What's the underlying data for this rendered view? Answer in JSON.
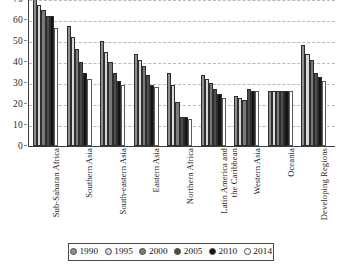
{
  "chart_data": {
    "type": "bar",
    "title": "",
    "subtitle": "",
    "xlabel": "",
    "ylabel": "",
    "ylim": [
      0,
      70
    ],
    "yticks": [
      0,
      10,
      20,
      30,
      40,
      50,
      60,
      70
    ],
    "grid": true,
    "legend_position": "bottom",
    "categories": [
      "Sub-Saharan Africa",
      "Southern Asia",
      "South-eastern Asia",
      "Eastern Asia",
      "Northern Africa",
      "Latin America and the Caribbean",
      "Western Asia",
      "Oceania",
      "Developing Regions"
    ],
    "category_lines": [
      [
        "Sub-Saharan Africa"
      ],
      [
        "Southern Asia"
      ],
      [
        "South-eastern Asia"
      ],
      [
        "Eastern Asia"
      ],
      [
        "Northern Africa"
      ],
      [
        "Latin America and",
        "the Caribbean"
      ],
      [
        "Western Asia"
      ],
      [
        "Oceania"
      ],
      [
        "Developing Regions"
      ]
    ],
    "series": [
      {
        "name": "1990",
        "color": "#8f8f8f",
        "values": [
          70,
          57,
          50,
          44,
          35,
          34,
          24,
          26,
          48
        ]
      },
      {
        "name": "1995",
        "color": "#d8d8d8",
        "values": [
          67,
          52,
          45,
          41,
          29,
          32,
          23,
          26,
          44
        ]
      },
      {
        "name": "2000",
        "color": "#7a7a7a",
        "values": [
          65,
          46,
          40,
          38,
          21,
          30,
          22,
          26,
          41
        ]
      },
      {
        "name": "2005",
        "color": "#4d4d4d",
        "values": [
          62,
          40,
          35,
          34,
          14,
          27,
          27,
          26,
          35
        ]
      },
      {
        "name": "2010",
        "color": "#141414",
        "values": [
          62,
          35,
          31,
          29,
          14,
          25,
          26,
          26,
          33
        ]
      },
      {
        "name": "2014",
        "color": "#ffffff",
        "values": [
          56,
          32,
          29,
          28,
          13,
          23,
          26,
          26,
          31
        ]
      }
    ],
    "legend": [
      {
        "label": "1990",
        "color": "#8f8f8f"
      },
      {
        "label": "1995",
        "color": "#d8d8d8"
      },
      {
        "label": "2000",
        "color": "#7a7a7a"
      },
      {
        "label": "2005",
        "color": "#4d4d4d"
      },
      {
        "label": "2010",
        "color": "#141414"
      },
      {
        "label": "2014",
        "color": "#ffffff"
      }
    ],
    "axis_color": "#3d3d3d",
    "gridline_color": "#b9b9b9"
  }
}
